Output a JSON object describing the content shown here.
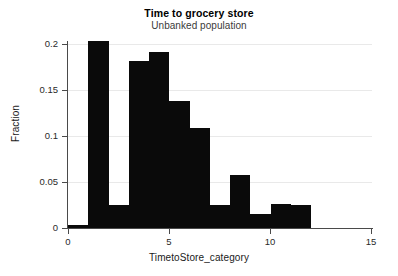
{
  "chart_data": {
    "type": "bar",
    "title": "Time to grocery store",
    "subtitle": "Unbanked population",
    "xlabel": "TimetoStore_category",
    "ylabel": "Fraction",
    "xlim": [
      0,
      15
    ],
    "ylim": [
      0,
      0.2
    ],
    "grid": "horizontal",
    "legend": "none",
    "bar_color": "#0a0a0a",
    "bin_width": 1,
    "x_ticks": [
      "0",
      "5",
      "10",
      "15"
    ],
    "x_tick_values": [
      0,
      5,
      10,
      15
    ],
    "y_ticks": [
      "0",
      "0.05",
      "0.1",
      "0.15",
      "0.2"
    ],
    "y_tick_values": [
      0,
      0.05,
      0.1,
      0.15,
      0.2
    ],
    "bins": [
      {
        "x0": 0,
        "x1": 1,
        "value": 0.003
      },
      {
        "x0": 1,
        "x1": 2,
        "value": 0.203
      },
      {
        "x0": 2,
        "x1": 3,
        "value": 0.0255
      },
      {
        "x0": 3,
        "x1": 4,
        "value": 0.182
      },
      {
        "x0": 4,
        "x1": 5,
        "value": 0.1915
      },
      {
        "x0": 5,
        "x1": 6,
        "value": 0.138
      },
      {
        "x0": 6,
        "x1": 7,
        "value": 0.109
      },
      {
        "x0": 7,
        "x1": 8,
        "value": 0.0255
      },
      {
        "x0": 8,
        "x1": 9,
        "value": 0.058
      },
      {
        "x0": 9,
        "x1": 10,
        "value": 0.015
      },
      {
        "x0": 10,
        "x1": 11,
        "value": 0.0265
      },
      {
        "x0": 11,
        "x1": 12,
        "value": 0.0255
      }
    ],
    "categories": [
      "0-1",
      "1-2",
      "2-3",
      "3-4",
      "4-5",
      "5-6",
      "6-7",
      "7-8",
      "8-9",
      "9-10",
      "10-11",
      "11-12"
    ],
    "values": [
      0.003,
      0.203,
      0.0255,
      0.182,
      0.1915,
      0.138,
      0.109,
      0.0255,
      0.058,
      0.015,
      0.0265,
      0.0255
    ]
  }
}
